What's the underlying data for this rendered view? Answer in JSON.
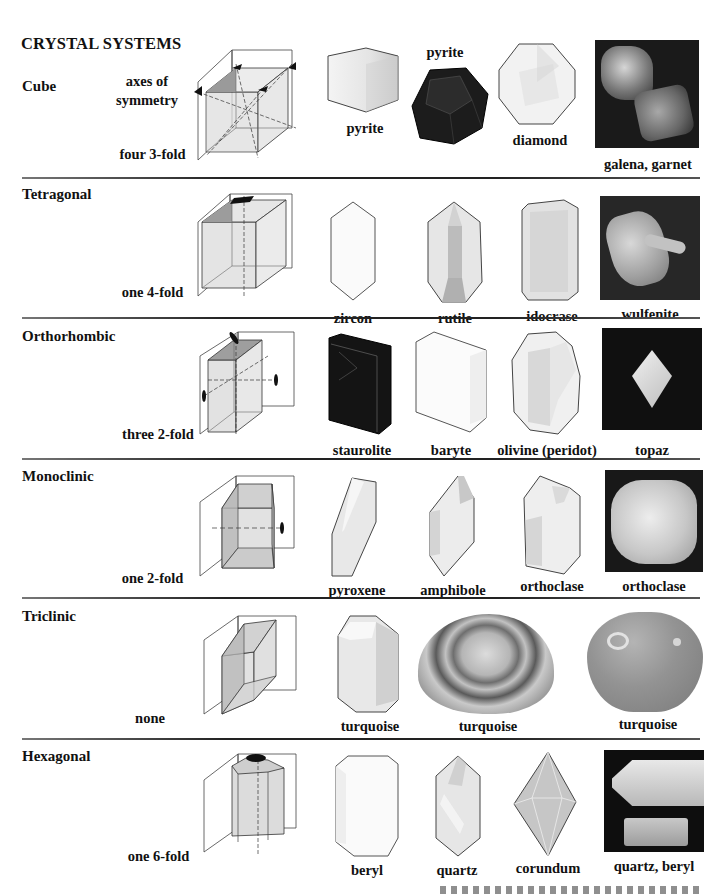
{
  "page": {
    "title": "CRYSTAL SYSTEMS",
    "axes_label": "axes of symmetry"
  },
  "systems": [
    {
      "name": "Cube",
      "symmetry": "four 3-fold",
      "specimens": [
        {
          "label": "pyrite",
          "kind": "drawing-cube"
        },
        {
          "label": "pyrite",
          "kind": "drawing-dodecahedron-dark"
        },
        {
          "label": "diamond",
          "kind": "drawing-octagon-faceted"
        },
        {
          "label": "galena, garnet",
          "kind": "photo"
        }
      ]
    },
    {
      "name": "Tetragonal",
      "symmetry": "one 4-fold",
      "specimens": [
        {
          "label": "zircon",
          "kind": "drawing-prism"
        },
        {
          "label": "rutile",
          "kind": "drawing-prism-faceted"
        },
        {
          "label": "idocrase",
          "kind": "drawing-block"
        },
        {
          "label": "wulfenite",
          "kind": "photo"
        }
      ]
    },
    {
      "name": "Orthorhombic",
      "symmetry": "three 2-fold",
      "specimens": [
        {
          "label": "staurolite",
          "kind": "drawing-block-dark"
        },
        {
          "label": "baryte",
          "kind": "drawing-tablet"
        },
        {
          "label": "olivine (peridot)",
          "kind": "drawing-faceted"
        },
        {
          "label": "topaz",
          "kind": "photo"
        }
      ]
    },
    {
      "name": "Monoclinic",
      "symmetry": "one 2-fold",
      "specimens": [
        {
          "label": "pyroxene",
          "kind": "drawing-slanted"
        },
        {
          "label": "amphibole",
          "kind": "drawing-slanted-faceted"
        },
        {
          "label": "orthoclase",
          "kind": "drawing-block-faceted"
        },
        {
          "label": "orthoclase",
          "kind": "photo"
        }
      ]
    },
    {
      "name": "Triclinic",
      "symmetry": "none",
      "specimens": [
        {
          "label": "turquoise",
          "kind": "drawing-prism"
        },
        {
          "label": "turquoise",
          "kind": "photo-mottled-pebble"
        },
        {
          "label": "turquoise",
          "kind": "photo-cabochon"
        }
      ]
    },
    {
      "name": "Hexagonal",
      "symmetry": "one 6-fold",
      "specimens": [
        {
          "label": "beryl",
          "kind": "drawing-hex-prism"
        },
        {
          "label": "quartz",
          "kind": "drawing-quartz"
        },
        {
          "label": "corundum",
          "kind": "drawing-bipyramid"
        },
        {
          "label": "quartz, beryl",
          "kind": "photo"
        }
      ]
    }
  ],
  "colors": {
    "divider": "#222222",
    "diagram_line": "#333333",
    "diagram_face": "#d8d8d8",
    "photo_bg": "#1a1a1a",
    "turquoise_cabochon": "#8c8c8c"
  }
}
